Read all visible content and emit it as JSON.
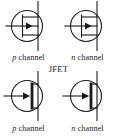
{
  "figure": {
    "title": "JFET",
    "center_label": "JFET",
    "background_color": "#ffffff",
    "stroke_color": "#1a1a1a",
    "symbols": [
      {
        "id": "top-left",
        "type": "jfet-p-channel-igfet-style",
        "channel": "p",
        "caption_italic": "p",
        "caption_rest": " channel",
        "gate_arrow_direction": "right",
        "channel_bar_style": "open"
      },
      {
        "id": "top-right",
        "type": "jfet-n-channel-igfet-style",
        "channel": "n",
        "caption_italic": "n",
        "caption_rest": " channel",
        "gate_arrow_direction": "right",
        "channel_bar_style": "open"
      },
      {
        "id": "bottom-left",
        "type": "jfet-p-channel-solid-bar",
        "channel": "p",
        "caption_italic": "p",
        "caption_rest": " channel",
        "gate_arrow_direction": "right",
        "channel_bar_style": "solid"
      },
      {
        "id": "bottom-right",
        "type": "jfet-n-channel-solid-bar",
        "channel": "n",
        "caption_italic": "n",
        "caption_rest": " channel",
        "gate_arrow_direction": "right",
        "channel_bar_style": "solid"
      }
    ]
  }
}
